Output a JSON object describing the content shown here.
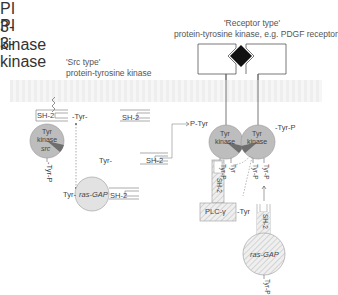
{
  "src_section": {
    "title_line1": "'Src type'",
    "title_line2": "protein-tyrosine kinase",
    "sh2_label": "SH-2",
    "kinase_line1": "Tyr",
    "kinase_line2": "kinase",
    "kinase_name": "src",
    "tyr_p_label": "-Tyr-P",
    "pi3k": {
      "tyr_label": "-Tyr-",
      "line1": "PI",
      "line2": "3-kinase",
      "sh2_label": "SH-2"
    },
    "pi3k_free": {
      "tyr_label": "Tyr-",
      "line1": "PI",
      "line2": "3-kinase",
      "sh2_label": "SH-2"
    },
    "rasgap": {
      "tyr_label": "Tyr-",
      "name": "ras-GAP",
      "sh2_label": "SH-2"
    }
  },
  "receptor_section": {
    "title_line1": "'Receptor type'",
    "title_line2": "protein-tyrosine kinase, e.g. PDGF receptor",
    "left_kinase": {
      "line1": "Tyr",
      "line2": "kinase",
      "ptyr_label": "P-Tyr",
      "bottom_left": "Tyr-P",
      "bottom_right": "Tyr"
    },
    "right_kinase": {
      "line1": "Tyr",
      "line2": "kinase",
      "tyrp_label": "-Tyr-P",
      "bottom_left": "Tyr-P",
      "bottom_right": "Tyr-P"
    },
    "plc": {
      "name": "PLC-γ",
      "tyr_label": "-Tyr",
      "sh2_label": "SH-2"
    },
    "rasgap": {
      "name": "ras-GAP",
      "sh2_label": "SH-2",
      "tyr_p_label": "Tyr-P"
    }
  },
  "colors": {
    "kinase_fill": "#bdbdbd",
    "kinase_wedge": "#6e6e6e",
    "pi3k_fill": "#8f8f8f",
    "ligand": "#111111",
    "membrane": "#eeeeee",
    "hatch": "#cfcfcf"
  }
}
